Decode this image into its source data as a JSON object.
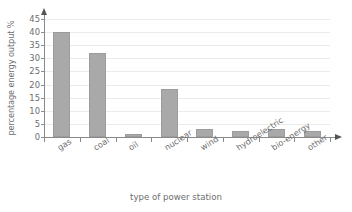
{
  "chart_data": {
    "type": "bar",
    "title": "",
    "subtitle": "",
    "xlabel": "type of power station",
    "ylabel": "percentage energy output %",
    "categories": [
      "gas",
      "coal",
      "oil",
      "nuclear",
      "wind",
      "hydroelectric",
      "bio-energy",
      "other"
    ],
    "values": [
      40,
      32,
      1,
      18.5,
      3,
      2.2,
      3.2,
      2.3
    ],
    "ylim": [
      0,
      45
    ],
    "ytick_labels": [
      "0",
      "5",
      "10",
      "15",
      "20",
      "25",
      "30",
      "35",
      "40",
      "45"
    ],
    "ytick_values": [
      0,
      5,
      10,
      15,
      20,
      25,
      30,
      35,
      40,
      45
    ],
    "grid": true,
    "grid_axis": "y",
    "legend": false,
    "legend_position": "none",
    "bar_color": "#a9a9a9",
    "grid_color": "#ebebeb",
    "axis_color": "#8a8a8a",
    "text_color": "#6e6e6e",
    "annotations": []
  },
  "axes": {
    "y_title": "percentage energy output %",
    "x_title": "type of power station"
  }
}
